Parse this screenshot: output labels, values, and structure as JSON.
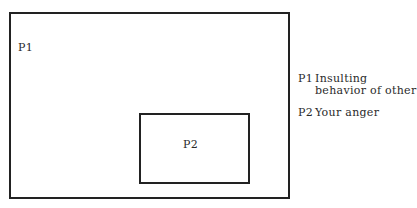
{
  "diagram": {
    "type": "nested-boxes",
    "outer_box": {
      "label": "P1"
    },
    "inner_box": {
      "label": "P2"
    },
    "legend": [
      {
        "key": "P1",
        "text": "Insulting behavior of other"
      },
      {
        "key": "P2",
        "text": "Your anger"
      }
    ],
    "colors": {
      "line": "#222222",
      "text": "#2a2a2a",
      "background": "#ffffff"
    }
  }
}
